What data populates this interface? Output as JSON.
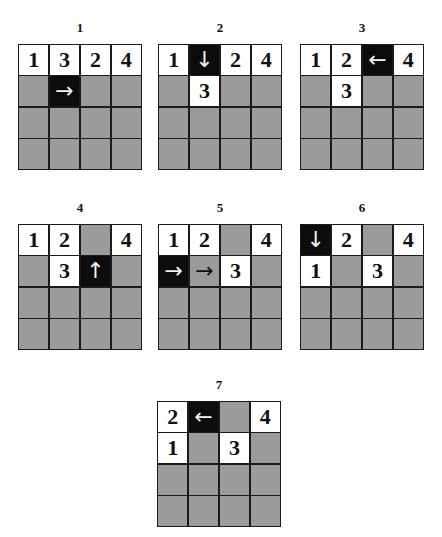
{
  "colors": {
    "empty": "#9b9b9b",
    "filled": "#ffffff",
    "active": "#0c0c0c",
    "border": "#1a1a1a"
  },
  "panels": [
    {
      "label": "1",
      "left": 18,
      "top": 20,
      "cells": [
        {
          "t": "white",
          "v": "1"
        },
        {
          "t": "white",
          "v": "3"
        },
        {
          "t": "white",
          "v": "2"
        },
        {
          "t": "white",
          "v": "4"
        },
        {
          "t": "gray",
          "v": ""
        },
        {
          "t": "black",
          "v": "→"
        },
        {
          "t": "gray",
          "v": ""
        },
        {
          "t": "gray",
          "v": ""
        },
        {
          "t": "gray",
          "v": ""
        },
        {
          "t": "gray",
          "v": ""
        },
        {
          "t": "gray",
          "v": ""
        },
        {
          "t": "gray",
          "v": ""
        },
        {
          "t": "gray",
          "v": ""
        },
        {
          "t": "gray",
          "v": ""
        },
        {
          "t": "gray",
          "v": ""
        },
        {
          "t": "gray",
          "v": ""
        }
      ]
    },
    {
      "label": "2",
      "left": 158,
      "top": 20,
      "cells": [
        {
          "t": "white",
          "v": "1"
        },
        {
          "t": "black",
          "v": "↓"
        },
        {
          "t": "white",
          "v": "2"
        },
        {
          "t": "white",
          "v": "4"
        },
        {
          "t": "gray",
          "v": ""
        },
        {
          "t": "white",
          "v": "3"
        },
        {
          "t": "gray",
          "v": ""
        },
        {
          "t": "gray",
          "v": ""
        },
        {
          "t": "gray",
          "v": ""
        },
        {
          "t": "gray",
          "v": ""
        },
        {
          "t": "gray",
          "v": ""
        },
        {
          "t": "gray",
          "v": ""
        },
        {
          "t": "gray",
          "v": ""
        },
        {
          "t": "gray",
          "v": ""
        },
        {
          "t": "gray",
          "v": ""
        },
        {
          "t": "gray",
          "v": ""
        }
      ]
    },
    {
      "label": "3",
      "left": 300,
      "top": 20,
      "cells": [
        {
          "t": "white",
          "v": "1"
        },
        {
          "t": "white",
          "v": "2"
        },
        {
          "t": "black",
          "v": "←"
        },
        {
          "t": "white",
          "v": "4"
        },
        {
          "t": "gray",
          "v": ""
        },
        {
          "t": "white",
          "v": "3"
        },
        {
          "t": "gray",
          "v": ""
        },
        {
          "t": "gray",
          "v": ""
        },
        {
          "t": "gray",
          "v": ""
        },
        {
          "t": "gray",
          "v": ""
        },
        {
          "t": "gray",
          "v": ""
        },
        {
          "t": "gray",
          "v": ""
        },
        {
          "t": "gray",
          "v": ""
        },
        {
          "t": "gray",
          "v": ""
        },
        {
          "t": "gray",
          "v": ""
        },
        {
          "t": "gray",
          "v": ""
        }
      ]
    },
    {
      "label": "4",
      "left": 18,
      "top": 200,
      "cells": [
        {
          "t": "white",
          "v": "1"
        },
        {
          "t": "white",
          "v": "2"
        },
        {
          "t": "gray",
          "v": ""
        },
        {
          "t": "white",
          "v": "4"
        },
        {
          "t": "gray",
          "v": ""
        },
        {
          "t": "white",
          "v": "3"
        },
        {
          "t": "black",
          "v": "↑"
        },
        {
          "t": "gray",
          "v": ""
        },
        {
          "t": "gray",
          "v": ""
        },
        {
          "t": "gray",
          "v": ""
        },
        {
          "t": "gray",
          "v": ""
        },
        {
          "t": "gray",
          "v": ""
        },
        {
          "t": "gray",
          "v": ""
        },
        {
          "t": "gray",
          "v": ""
        },
        {
          "t": "gray",
          "v": ""
        },
        {
          "t": "gray",
          "v": ""
        }
      ]
    },
    {
      "label": "5",
      "left": 158,
      "top": 200,
      "cells": [
        {
          "t": "white",
          "v": "1"
        },
        {
          "t": "white",
          "v": "2"
        },
        {
          "t": "gray",
          "v": ""
        },
        {
          "t": "white",
          "v": "4"
        },
        {
          "t": "black",
          "v": "→"
        },
        {
          "t": "grayarrow",
          "v": "→"
        },
        {
          "t": "white",
          "v": "3"
        },
        {
          "t": "gray",
          "v": ""
        },
        {
          "t": "gray",
          "v": ""
        },
        {
          "t": "gray",
          "v": ""
        },
        {
          "t": "gray",
          "v": ""
        },
        {
          "t": "gray",
          "v": ""
        },
        {
          "t": "gray",
          "v": ""
        },
        {
          "t": "gray",
          "v": ""
        },
        {
          "t": "gray",
          "v": ""
        },
        {
          "t": "gray",
          "v": ""
        }
      ]
    },
    {
      "label": "6",
      "left": 300,
      "top": 200,
      "cells": [
        {
          "t": "black",
          "v": "↓"
        },
        {
          "t": "white",
          "v": "2"
        },
        {
          "t": "gray",
          "v": ""
        },
        {
          "t": "white",
          "v": "4"
        },
        {
          "t": "white",
          "v": "1"
        },
        {
          "t": "gray",
          "v": ""
        },
        {
          "t": "white",
          "v": "3"
        },
        {
          "t": "gray",
          "v": ""
        },
        {
          "t": "gray",
          "v": ""
        },
        {
          "t": "gray",
          "v": ""
        },
        {
          "t": "gray",
          "v": ""
        },
        {
          "t": "gray",
          "v": ""
        },
        {
          "t": "gray",
          "v": ""
        },
        {
          "t": "gray",
          "v": ""
        },
        {
          "t": "gray",
          "v": ""
        },
        {
          "t": "gray",
          "v": ""
        }
      ]
    },
    {
      "label": "7",
      "left": 157,
      "top": 377,
      "cells": [
        {
          "t": "white",
          "v": "2"
        },
        {
          "t": "black",
          "v": "←"
        },
        {
          "t": "gray",
          "v": ""
        },
        {
          "t": "white",
          "v": "4"
        },
        {
          "t": "white",
          "v": "1"
        },
        {
          "t": "gray",
          "v": ""
        },
        {
          "t": "white",
          "v": "3"
        },
        {
          "t": "gray",
          "v": ""
        },
        {
          "t": "gray",
          "v": ""
        },
        {
          "t": "gray",
          "v": ""
        },
        {
          "t": "gray",
          "v": ""
        },
        {
          "t": "gray",
          "v": ""
        },
        {
          "t": "gray",
          "v": ""
        },
        {
          "t": "gray",
          "v": ""
        },
        {
          "t": "gray",
          "v": ""
        },
        {
          "t": "gray",
          "v": ""
        }
      ]
    }
  ]
}
